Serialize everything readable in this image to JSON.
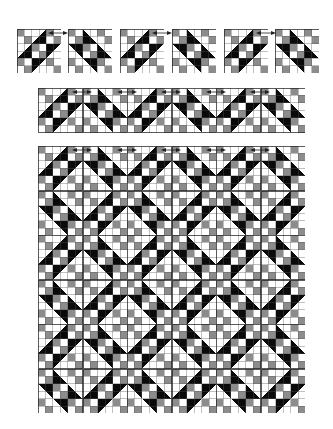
{
  "diagram": {
    "title": "",
    "colors": {
      "black": "#0a0a0a",
      "gray": "#8c8c8c",
      "white": "#ffffff",
      "grid_line": "#555555",
      "border": "#222222",
      "arrow": "#222222"
    },
    "block_pattern_note": "6x6 cell grid: four-patch units at corners and center, half-square-triangle units on edges",
    "blocks": {
      "A": {
        "orientation": "/",
        "units": [
          [
            "fp",
            "hst-br",
            "fp"
          ],
          [
            "hst-br",
            "fp",
            "hst-tl"
          ],
          [
            "fp",
            "hst-tl",
            "fp"
          ]
        ]
      },
      "B": {
        "orientation": "\\",
        "units": [
          [
            "fp",
            "hst-bl",
            "fp"
          ],
          [
            "hst-tr",
            "fp",
            "hst-bl"
          ],
          [
            "fp",
            "hst-tr",
            "fp"
          ]
        ]
      }
    },
    "top_row": {
      "label": "individual blocks",
      "blocks": [
        "A",
        "B",
        "A",
        "B",
        "A",
        "B"
      ],
      "x": [
        17,
        68,
        120,
        172,
        224,
        275
      ],
      "y": 29,
      "size": 44,
      "arrows_x": [
        58,
        162,
        266
      ]
    },
    "strip": {
      "label": "joined row",
      "blocks": [
        "A",
        "B",
        "A",
        "B",
        "A",
        "B"
      ],
      "x": 38,
      "y": 88,
      "size": 44.5,
      "arrows_x": [
        82,
        127,
        171,
        216,
        260
      ]
    },
    "quilt": {
      "label": "full quilt layout",
      "rows": [
        [
          "A",
          "B",
          "A",
          "B",
          "A",
          "B"
        ],
        [
          "B",
          "A",
          "B",
          "A",
          "B",
          "A"
        ],
        [
          "A",
          "B",
          "A",
          "B",
          "A",
          "B"
        ],
        [
          "B",
          "A",
          "B",
          "A",
          "B",
          "A"
        ],
        [
          "A",
          "B",
          "A",
          "B",
          "A",
          "B"
        ],
        [
          "B",
          "A",
          "B",
          "A",
          "B",
          "A"
        ]
      ],
      "x": 38,
      "y": 146,
      "size": 44.5,
      "arrows_x": [
        82,
        127,
        171,
        216,
        260
      ]
    }
  }
}
